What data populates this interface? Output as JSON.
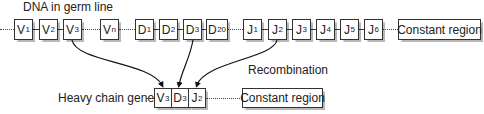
{
  "title": "DNA in germ line",
  "recombination_label": "Recombination",
  "germline": {
    "segments": [
      {
        "letter": "V",
        "sub": "1",
        "x": 14,
        "w": 19
      },
      {
        "letter": "V",
        "sub": "2",
        "x": 39,
        "w": 19
      },
      {
        "letter": "V",
        "sub": "3",
        "x": 63,
        "w": 19
      },
      {
        "letter": "V",
        "sub": "n",
        "x": 100,
        "w": 19
      },
      {
        "letter": "D",
        "sub": "1",
        "x": 135,
        "w": 19
      },
      {
        "letter": "D",
        "sub": "2",
        "x": 159,
        "w": 19
      },
      {
        "letter": "D",
        "sub": "3",
        "x": 183,
        "w": 19
      },
      {
        "letter": "D",
        "sub": "20",
        "x": 206,
        "w": 22
      },
      {
        "letter": "J",
        "sub": "1",
        "x": 243,
        "w": 19
      },
      {
        "letter": "J",
        "sub": "2",
        "x": 268,
        "w": 19
      },
      {
        "letter": "J",
        "sub": "3",
        "x": 292,
        "w": 19
      },
      {
        "letter": "J",
        "sub": "4",
        "x": 316,
        "w": 19
      },
      {
        "letter": "J",
        "sub": "5",
        "x": 340,
        "w": 19
      },
      {
        "letter": "J",
        "sub": "6",
        "x": 364,
        "w": 19
      }
    ],
    "constant_region": "Constant region"
  },
  "heavy_chain": {
    "label": "Heavy chain gene",
    "segments": [
      {
        "letter": "V",
        "sub": "3"
      },
      {
        "letter": "D",
        "sub": "3"
      },
      {
        "letter": "J",
        "sub": "2"
      }
    ],
    "constant_region": "Constant region"
  }
}
